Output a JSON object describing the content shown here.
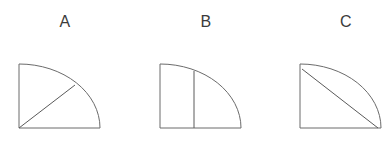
{
  "canvas": {
    "width": 391,
    "height": 147,
    "background_color": "#ffffff"
  },
  "style": {
    "stroke_color": "#6b6b6b",
    "chord_stroke_color": "#5a5a5a",
    "stroke_width": 1,
    "fill": "none",
    "label_color": "#3b3b3b",
    "label_font_size": 16
  },
  "figures": [
    {
      "label": "A",
      "shape": "quarter-circle",
      "description": "Quarter circle with arc centered at bottom-left corner and a radius line drawn at 45 degrees from the center to the midpoint of the arc",
      "divider": {
        "type": "radius-45",
        "name": "diagonal-radius-line",
        "from": "bottom-left-corner",
        "to": "arc-midpoint"
      },
      "box": {
        "x": 17,
        "y": 63,
        "width": 81,
        "height": 65
      }
    },
    {
      "label": "B",
      "shape": "quarter-circle",
      "description": "Quarter circle with arc centered at bottom-left corner and a vertical line splitting the figure at about 42 percent of the width",
      "divider": {
        "type": "vertical-chord",
        "name": "vertical-divider-line",
        "position_ratio": 0.42
      },
      "box": {
        "x": 158,
        "y": 63,
        "width": 81,
        "height": 65
      }
    },
    {
      "label": "C",
      "shape": "quarter-circle",
      "description": "Quarter circle with arc centered at bottom-left corner and a diagonal chord from the top-left corner to the bottom-right corner",
      "divider": {
        "type": "diagonal-chord",
        "name": "diagonal-chord-line",
        "from": "top-left-corner",
        "to": "bottom-right-corner"
      },
      "box": {
        "x": 298,
        "y": 63,
        "width": 81,
        "height": 65
      }
    }
  ]
}
